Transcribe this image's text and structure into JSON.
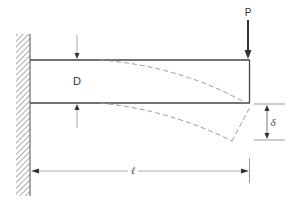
{
  "diagram": {
    "type": "cantilever-beam-deflection",
    "labels": {
      "load": "P",
      "depth": "D",
      "deflection": "δ",
      "length": "ℓ"
    },
    "elements": {
      "support": "fixed wall (hatched)",
      "beam": "rectangular beam, undeformed (solid)",
      "deflected_shape": "deformed beam outline (dashed)",
      "load_arrow": "downward point load at free end",
      "depth_dimension": "arrows above and below beam at left",
      "deflection_dimension": "vertical arrow between two horizontal reference lines at right",
      "length_dimension": "horizontal arrow from wall to free end"
    },
    "colors": {
      "line": "#444444",
      "dashed": "#9a9a9a",
      "hatch": "#888888",
      "dim": "#999999"
    }
  }
}
